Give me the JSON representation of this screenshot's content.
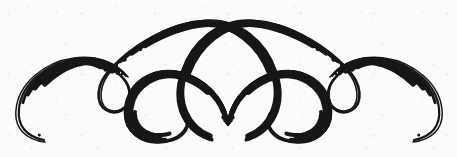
{
  "image": {
    "kind": "decorative-ornament",
    "title": "Calligraphic Flourish Ornament",
    "description": "A symmetrical black pen-and-ink decorative divider made of two large crossing arcs, two inward-facing spirals, two small side loops and two tapered outer crescents.",
    "medium": "pen and ink on paper",
    "width_px": 457,
    "height_px": 157,
    "background_color": "#fbfbfa",
    "ink_color": "#141414",
    "symmetry": "bilateral (left-right mirror about x = 228)"
  },
  "geometry": {
    "center_x": 228,
    "top_crossing": {
      "x": 228,
      "y": 38
    },
    "bottom_crossing": {
      "x": 228,
      "y": 125
    },
    "arc_apex_y": 21,
    "lowest_ink_y": 141,
    "leftmost_ink_x": 14,
    "rightmost_ink_x": 443,
    "stroke_min_px": 1.2,
    "stroke_max_px": 8.0
  },
  "strokes": [
    {
      "id": "left-outer-crescent",
      "name": "Left outer crescent",
      "description": "Thick crescent sweeping from the small left loop down and around the far left edge, tapering to a hairline tail at lower left.",
      "weight": "thick-tapering",
      "path": "M 128 77 C 116 62 96 55 74 58 C 44 62 18 84 16 110 C 14 128 26 140 45 142",
      "width_start": 1.4,
      "width_mid": 8.0,
      "width_end": 1.2
    },
    {
      "id": "left-small-loop",
      "name": "Left small loop",
      "description": "Narrow upright teardrop loop between the outer crescent and the big left arc.",
      "weight": "thin",
      "path": "M 92 63 C 116 66 131 82 130 96 C 129 110 116 116 106 110 C 95 103 96 84 110 70 C 128 51 164 33 196 26",
      "width_start": 2.2,
      "width_mid": 3.2,
      "width_end": 4.6
    },
    {
      "id": "left-great-arc",
      "name": "Left great arc",
      "description": "Large sweeping arc rising from the left loop over the top and descending through the centre crossing into the right spiral.",
      "weight": "medium-thick",
      "path": "M 110 70 C 130 48 168 23 205 21 C 240 19 266 42 276 72 C 288 106 272 133 246 140",
      "width_start": 3.0,
      "width_mid": 5.6,
      "width_end": 6.0
    },
    {
      "id": "left-spiral",
      "name": "Left inner spiral",
      "description": "Counter-clockwise spiral in the left half, coiling inward to a hairline tip at its centre.",
      "weight": "thick-to-hairline",
      "path": "M 228 125 C 224 99 206 78 180 72 C 152 66 128 82 125 108 C 122 132 142 146 166 142 C 186 139 193 124 186 113",
      "width_start": 6.2,
      "width_mid": 5.0,
      "width_end": 1.3
    },
    {
      "id": "right-great-arc",
      "name": "Right great arc",
      "description": "Mirror of the left great arc: rises from the right loop over the top and descends through the centre crossing into the left spiral.",
      "weight": "medium-thick",
      "path": "M 348 70 C 328 48 290 23 253 21 C 218 19 192 42 182 72 C 170 106 186 133 212 140",
      "width_start": 3.0,
      "width_mid": 5.6,
      "width_end": 6.0
    },
    {
      "id": "right-spiral",
      "name": "Right inner spiral",
      "description": "Clockwise spiral in the right half, coiling inward to a hairline tip at its centre.",
      "weight": "thick-to-hairline",
      "path": "M 228 125 C 232 99 250 78 276 72 C 304 66 328 82 331 108 C 334 132 314 146 290 142 C 270 139 263 124 270 113",
      "width_start": 6.2,
      "width_mid": 5.0,
      "width_end": 1.3
    },
    {
      "id": "right-small-loop",
      "name": "Right small loop",
      "description": "Narrow upright teardrop loop between the big right arc and the outer crescent.",
      "weight": "thin",
      "path": "M 366 63 C 342 66 327 82 328 96 C 329 110 342 116 352 110 C 363 103 362 84 348 70 C 330 51 294 33 262 26",
      "width_start": 2.2,
      "width_mid": 3.2,
      "width_end": 4.6
    },
    {
      "id": "right-outer-crescent",
      "name": "Right outer crescent",
      "description": "Thick crescent sweeping from the small right loop down and around the far right edge, tapering to a hairline tail at lower right.",
      "weight": "thick-tapering",
      "path": "M 330 77 C 342 62 362 55 384 58 C 414 62 440 84 442 110 C 444 128 432 140 413 142",
      "width_start": 1.4,
      "width_mid": 8.0,
      "width_end": 1.2
    }
  ]
}
